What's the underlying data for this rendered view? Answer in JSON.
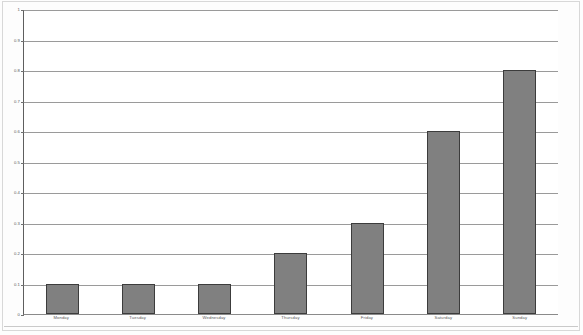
{
  "chart_data": {
    "type": "bar",
    "title": "",
    "subtitle": "",
    "xlabel": "",
    "ylabel": "",
    "categories": [
      "Monday",
      "Tuesday",
      "Wednesday",
      "Thursday",
      "Friday",
      "Saturday",
      "Sunday"
    ],
    "values": [
      0.1,
      0.1,
      0.1,
      0.2,
      0.3,
      0.6,
      0.8
    ],
    "ylim": [
      0,
      1
    ],
    "ytick_step": 0.1,
    "ytick_labels": [
      "1",
      "0.9",
      "0.8",
      "0.7",
      "0.6",
      "0.5",
      "0.4",
      "0.3",
      "0.2",
      "0.1",
      "0"
    ],
    "ytick_values": [
      1,
      0.9,
      0.8,
      0.7,
      0.6,
      0.5,
      0.4,
      0.3,
      0.2,
      0.1,
      0
    ],
    "grid": true,
    "grid_axis": "y",
    "legend": false,
    "legend_position": "none",
    "annotations": [],
    "colors": {
      "bar_fill": "#808080",
      "bar_border": "#3c3c3c",
      "gridline": "#9a9a9a",
      "axis": "#5e5e5e",
      "tick_label": "#5a5a5a",
      "plot_background": "#ffffff",
      "page_background": "#fdfdfd"
    }
  }
}
